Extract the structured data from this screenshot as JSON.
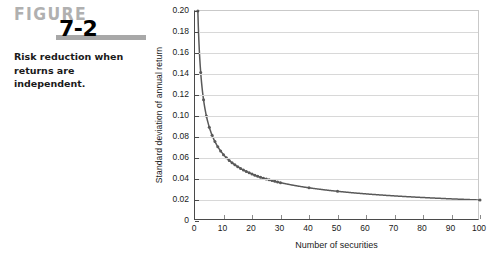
{
  "figure": {
    "label_word": "FIGURE",
    "number": "7-2",
    "caption": "Risk reduction when returns are independent."
  },
  "colors": {
    "figure_word": "#b0b0b0",
    "rule_bar": "#a8a8a8",
    "axis": "#4a4a4a",
    "grid": "#d8d8d8",
    "curve": "#595959",
    "frame": "#c9c9c9"
  },
  "chart_data": {
    "type": "line",
    "title": "",
    "xlabel": "Number of securities",
    "ylabel": "Standard deviation of annual return",
    "xlim": [
      0,
      100
    ],
    "ylim": [
      0,
      0.2
    ],
    "grid": true,
    "legend": "none",
    "markers": true,
    "xticks": [
      0,
      10,
      20,
      30,
      40,
      50,
      60,
      70,
      80,
      90,
      100
    ],
    "xtick_labels": [
      "0",
      "10",
      "20",
      "30",
      "40",
      "50",
      "60",
      "70",
      "80",
      "90",
      "100"
    ],
    "yticks": [
      0,
      0.02,
      0.04,
      0.06,
      0.08,
      0.1,
      0.12,
      0.14,
      0.16,
      0.18,
      0.2
    ],
    "ytick_labels": [
      "0",
      "0.02",
      "0.04",
      "0.06",
      "0.08",
      "0.10",
      "0.12",
      "0.14",
      "0.16",
      "0.18",
      "0.20"
    ],
    "formula": "sigma = 0.20 / sqrt(n)",
    "x": [
      1,
      2,
      3,
      4,
      5,
      6,
      7,
      8,
      9,
      10,
      11,
      12,
      13,
      14,
      15,
      16,
      17,
      18,
      19,
      20,
      21,
      22,
      23,
      24,
      25,
      26,
      27,
      28,
      29,
      30,
      40,
      50,
      100
    ],
    "values": [
      0.2,
      0.1414,
      0.1155,
      0.1,
      0.0894,
      0.0816,
      0.0756,
      0.0707,
      0.0667,
      0.0632,
      0.0603,
      0.0577,
      0.0555,
      0.0535,
      0.0516,
      0.05,
      0.0485,
      0.0471,
      0.0459,
      0.0447,
      0.0436,
      0.0426,
      0.0417,
      0.0408,
      0.04,
      0.0392,
      0.0385,
      0.0378,
      0.0371,
      0.0365,
      0.0316,
      0.0283,
      0.02
    ]
  }
}
